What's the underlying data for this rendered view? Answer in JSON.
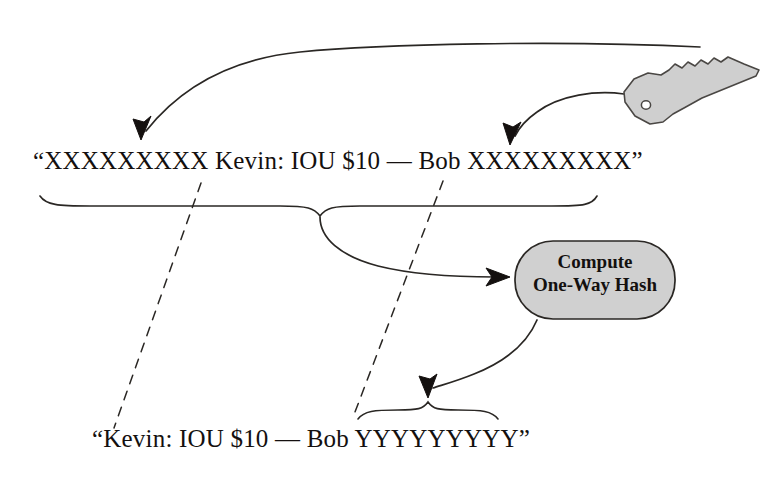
{
  "diagram": {
    "background_color": "#ffffff",
    "ink_color": "#14100f",
    "stroke_color": "#2a2724",
    "shape_fill": "#d0d0d0"
  },
  "texts": {
    "signed_message": "“XXXXXXXXX Kevin: IOU $10 — Bob XXXXXXXXX”",
    "hashed_message": "“Kevin: IOU $10 — Bob YYYYYYYYY”"
  },
  "hash_box": {
    "line1": "Compute",
    "line2": "One-Way Hash",
    "fill": "#d0d0d0",
    "stroke": "#2a2724"
  },
  "key_icon": {
    "name": "key-icon",
    "fill": "#cfcfcf",
    "stroke": "#4a4744"
  },
  "connectors": [
    {
      "name": "key-to-message-prefix-arrow",
      "from": "key",
      "to": "signed-message-left-padding",
      "style": "solid-curve-with-arrowhead"
    },
    {
      "name": "key-to-message-suffix-arrow",
      "from": "key",
      "to": "signed-message-right-padding",
      "style": "solid-curve-with-arrowhead"
    },
    {
      "name": "signed-message-brace",
      "style": "brace"
    },
    {
      "name": "brace-to-hash-arrow",
      "from": "signed-message-brace",
      "to": "hash-box",
      "style": "solid-curve-with-arrowhead"
    },
    {
      "name": "hash-to-output-arrow",
      "from": "hash-box",
      "to": "hashed-message-brace",
      "style": "solid-curve-with-arrowhead"
    },
    {
      "name": "hashed-message-brace",
      "style": "brace"
    },
    {
      "name": "dashed-correspondence-left",
      "style": "dashed-line"
    },
    {
      "name": "dashed-correspondence-right",
      "style": "dashed-line"
    }
  ]
}
